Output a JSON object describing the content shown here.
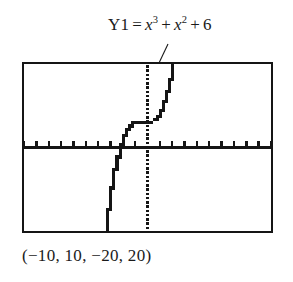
{
  "figure": {
    "background_color": "#ffffff",
    "ink_color": "#151515"
  },
  "label": {
    "name": "Y1",
    "equals": "=",
    "term1_base": "x",
    "term1_exp": "3",
    "plus1": "+",
    "term2_base": "x",
    "term2_exp": "2",
    "plus2": "+",
    "constant": "6",
    "full_text": "Y1 = x^3 + x^2 + 6"
  },
  "caption": {
    "text": "(−10, 10, −20, 20)"
  },
  "chart_data": {
    "type": "line",
    "subtitle": "(−10, 10, −20, 20)",
    "xlabel": "",
    "ylabel": "",
    "xlim": [
      -10,
      10
    ],
    "ylim": [
      -20,
      20
    ],
    "xscl": 1,
    "yscl": 1,
    "grid": false,
    "legend_position": "none",
    "axis_style": {
      "x_axis": "solid-with-ticks",
      "y_axis": "dotted-thick",
      "tick_count_x": 21,
      "tick_count_y": 41
    },
    "render_style": "pixelated-calculator-trace",
    "annotations": [
      {
        "text": "Y1 = x^3 + x^2 + 6",
        "leader_from": [
          168,
          44
        ],
        "leader_to": [
          150,
          82
        ]
      }
    ],
    "series": [
      {
        "name": "Y1 = x^3 + x^2 + 6",
        "expression": "y = x^3 + x^2 + 6",
        "color": "#151515",
        "x": [
          -3.3,
          -3.2,
          -3.1,
          -3.0,
          -2.9,
          -2.8,
          -2.7,
          -2.6,
          -2.5,
          -2.4,
          -2.3,
          -2.2,
          -2.1,
          -2.0,
          -1.9,
          -1.8,
          -1.7,
          -1.6,
          -1.5,
          -1.4,
          -1.3,
          -1.2,
          -1.1,
          -1.0,
          -0.9,
          -0.8,
          -0.7,
          -0.6,
          -0.5,
          -0.4,
          -0.3,
          -0.2,
          -0.1,
          0.0,
          0.1,
          0.2,
          0.3,
          0.4,
          0.5,
          0.6,
          0.7,
          0.8,
          0.9,
          1.0,
          1.1,
          1.2,
          1.3,
          1.4,
          1.5,
          1.6,
          1.7,
          1.8,
          1.9,
          2.0
        ],
        "y": [
          -19.05,
          -16.53,
          -14.18,
          -12.0,
          -9.98,
          -8.11,
          -6.39,
          -4.82,
          -3.38,
          -2.06,
          -0.87,
          0.2,
          1.16,
          2.0,
          2.75,
          3.41,
          3.98,
          4.46,
          4.88,
          5.22,
          5.49,
          5.71,
          5.88,
          6.0,
          6.08,
          6.13,
          6.15,
          6.14,
          6.13,
          6.1,
          6.06,
          6.03,
          6.01,
          6.0,
          6.01,
          6.05,
          6.12,
          6.22,
          6.38,
          6.58,
          6.83,
          7.15,
          7.54,
          8.0,
          8.54,
          9.17,
          9.89,
          10.7,
          11.63,
          12.66,
          13.8,
          15.07,
          16.47,
          18.0
        ]
      }
    ],
    "features": {
      "y_intercept": 6,
      "local_max_approx": [
        -0.667,
        6.15
      ],
      "local_min_approx": [
        0,
        6
      ],
      "x_intercept_approx": -2.22
    }
  }
}
